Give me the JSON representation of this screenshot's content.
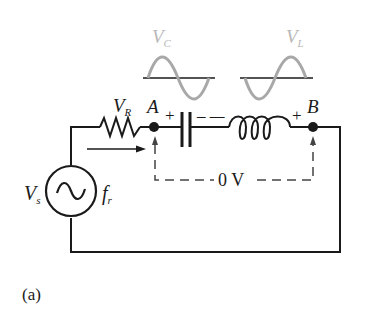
{
  "figure": {
    "caption": "(a)",
    "colors": {
      "wire": "#1a1a1a",
      "waveform": "#a8a8a8",
      "waveform_label": "#b8b8b8",
      "background": "#ffffff"
    }
  },
  "components": {
    "resistor": {
      "label_main": "V",
      "label_sub": "R"
    },
    "capacitor": {
      "polarity_left": "+",
      "polarity_right": "– –"
    },
    "inductor": {
      "polarity_left": "–",
      "polarity_right": "+"
    },
    "source": {
      "label_main": "V",
      "label_sub": "s",
      "freq_main": "f",
      "freq_sub": "r",
      "symbol": "~"
    }
  },
  "nodes": {
    "a": {
      "label": "A"
    },
    "b": {
      "label": "B"
    }
  },
  "waveforms": {
    "capacitor": {
      "label_main": "V",
      "label_sub": "C"
    },
    "inductor": {
      "label_main": "V",
      "label_sub": "L"
    }
  },
  "measurement": {
    "label": "0 V"
  }
}
